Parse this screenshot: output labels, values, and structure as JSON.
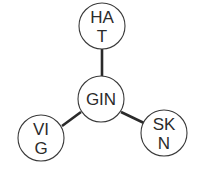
{
  "diagram": {
    "type": "star",
    "center": {
      "id": "GIN",
      "lines": [
        "GIN"
      ],
      "cx": 101,
      "cy": 99,
      "r": 23
    },
    "leaves": [
      {
        "id": "HAT",
        "lines": [
          "HA",
          "T"
        ],
        "cx": 102,
        "cy": 26,
        "r": 23
      },
      {
        "id": "VIG",
        "lines": [
          "VI",
          "G"
        ],
        "cx": 41,
        "cy": 138,
        "r": 23
      },
      {
        "id": "SKN",
        "lines": [
          "SK",
          "N"
        ],
        "cx": 164,
        "cy": 133,
        "r": 23
      }
    ],
    "edges": [
      {
        "from": "GIN",
        "to": "HAT",
        "x1": 102,
        "y1": 76,
        "x2": 102,
        "y2": 49
      },
      {
        "from": "GIN",
        "to": "VIG",
        "x1": 81,
        "y1": 112,
        "x2": 62,
        "y2": 126
      },
      {
        "from": "GIN",
        "to": "SKN",
        "x1": 121,
        "y1": 112,
        "x2": 144,
        "y2": 123
      }
    ],
    "colors": {
      "stroke": "#3a3a3a",
      "edge": "#2a2a2a",
      "text": "#2b2b2b",
      "background": "#ffffff"
    }
  }
}
